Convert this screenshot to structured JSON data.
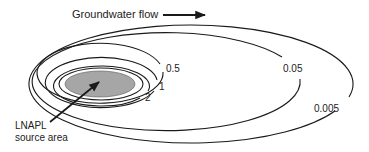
{
  "diagram": {
    "title_label": "Groundwater flow",
    "source_label_line1": "LNAPL",
    "source_label_line2": "source area",
    "contours": [
      {
        "label": "0.005"
      },
      {
        "label": "0.05"
      },
      {
        "label": "0.5"
      },
      {
        "label": "1"
      },
      {
        "label": "2"
      }
    ],
    "colors": {
      "line": "#1a1a1a",
      "source_fill": "#a6a6a6",
      "background": "#ffffff"
    }
  }
}
